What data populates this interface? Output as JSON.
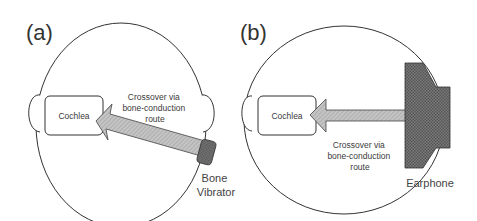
{
  "panels": [
    {
      "id": "a",
      "label": "(a)",
      "cochlea_label": "Cochlea",
      "route_label_lines": [
        "Crossover via",
        "bone-conduction",
        "route"
      ],
      "device_label_lines": [
        "Bone",
        "Vibrator"
      ]
    },
    {
      "id": "b",
      "label": "(b)",
      "cochlea_label": "Cochlea",
      "route_label_lines": [
        "Crossover via",
        "bone-conduction",
        "route"
      ],
      "device_label_lines": [
        "Earphone"
      ]
    }
  ],
  "colors": {
    "outline": "#333333",
    "arrow_fill": "#b8b8b8",
    "device_fill": "#6e6e6e",
    "background": "#ffffff"
  }
}
